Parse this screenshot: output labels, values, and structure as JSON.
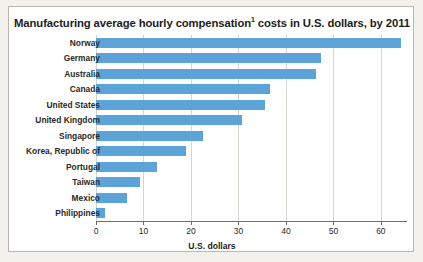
{
  "chart_data": {
    "type": "bar",
    "orientation": "horizontal",
    "title": "Manufacturing average hourly compensation",
    "title_superscript": "1",
    "title_suffix": " costs in U.S. dollars, by 2011",
    "title_full": "Manufacturing average hourly compensation¹ costs in U.S. dollars, by 2011",
    "xlabel": "U.S. dollars",
    "ylabel": "",
    "categories": [
      "Norway",
      "Germany",
      "Australia",
      "Canada",
      "United States",
      "United Kingdom",
      "Singapore",
      "Korea, Republic of",
      "Portugal",
      "Taiwan",
      "Mexico",
      "Philippines"
    ],
    "values": [
      64.2,
      47.4,
      46.3,
      36.6,
      35.5,
      30.8,
      22.6,
      18.9,
      12.9,
      9.3,
      6.5,
      2.0
    ],
    "xlim": [
      0,
      65.5
    ],
    "xticks": [
      0,
      10,
      20,
      30,
      40,
      50,
      60
    ],
    "xtick_labels": [
      "0",
      "10",
      "20",
      "30",
      "40",
      "50",
      "60"
    ],
    "grid": true,
    "grid_axis": "x",
    "legend": false,
    "bar_color": "#5ba3d9",
    "gridline_color": "#d7d5ce",
    "axis_color": "#6f6d68",
    "plot_background": "#ffffff",
    "figure_background": "#f2f1ec"
  }
}
